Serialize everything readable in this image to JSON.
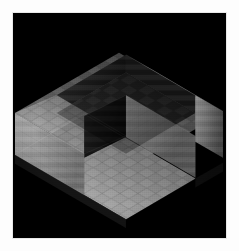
{
  "window": {
    "title": "Isometric Voxel Render",
    "canvas_label": "render-canvas"
  },
  "scene": {
    "description": "Isometric grayscale voxel block with rectangular notch",
    "background_color": "#000000",
    "frame_color": "#e8e8e8",
    "page_color": "#fdfdfd",
    "projection": "isometric",
    "tile_texture": "checker",
    "tile_size_px": 9
  },
  "palette": {
    "top_face_light": "#b4b4b4",
    "top_face_mid": "#8e8e8e",
    "top_face_dark": "#5a5a5a",
    "left_face_light": "#6e6e6e",
    "left_face_mid": "#4a4a4a",
    "left_face_dark": "#262626",
    "right_face_light": "#9a9a9a",
    "right_face_mid": "#767676",
    "right_face_dark": "#3c3c3c",
    "cavity_floor": "#2a2a2a",
    "cavity_shadow": "#101010",
    "void": "#000000"
  },
  "geometry": {
    "canvas": {
      "x": 12,
      "y": 12,
      "width": 215,
      "height": 227
    },
    "center": {
      "x": 107,
      "y": 113
    },
    "outer_hex": [
      [
        2,
        113
      ],
      [
        107,
        52
      ],
      [
        212,
        113
      ],
      [
        212,
        160
      ],
      [
        107,
        221
      ],
      [
        2,
        160
      ]
    ],
    "top_rim": [
      [
        2,
        113
      ],
      [
        107,
        52
      ],
      [
        212,
        113
      ],
      [
        107,
        174
      ]
    ],
    "notch_top_quad": [
      [
        46,
        113
      ],
      [
        116,
        72
      ],
      [
        186,
        113
      ],
      [
        116,
        154
      ]
    ],
    "notch_depth_px": 42,
    "slab_height_px": 47
  },
  "faces": [
    {
      "name": "top-rim-face",
      "tone": "#9a9a9a",
      "role": "upward"
    },
    {
      "name": "notch-floor-face",
      "tone": "#2e2e2e",
      "role": "upward"
    },
    {
      "name": "notch-left-wall",
      "tone": "#1a1a1a",
      "role": "inner-left"
    },
    {
      "name": "notch-right-wall",
      "tone": "#6a6a6a",
      "role": "inner-right"
    },
    {
      "name": "outer-left-face",
      "tone": "#888888",
      "role": "left"
    },
    {
      "name": "outer-right-face",
      "tone": "#4e4e4e",
      "role": "right"
    }
  ],
  "status": {
    "zoom": "100%",
    "shading": "flat",
    "grid": "on"
  }
}
